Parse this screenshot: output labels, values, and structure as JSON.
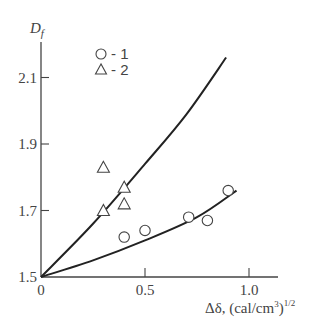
{
  "chart_data": {
    "type": "scatter",
    "title": "",
    "ylabel": "D_f",
    "ylabel_main": "D",
    "ylabel_sub": "f",
    "xlabel": "Δδ, (cal/cm³)^1/2",
    "xlabel_main": "Δδ, (cal/cm",
    "xlabel_sup1": "3",
    "xlabel_close": ")",
    "xlabel_sup2": "1/2",
    "xlim": [
      0,
      1.15
    ],
    "ylim": [
      1.5,
      2.2
    ],
    "x_ticks": [
      {
        "value": 0,
        "label": "0"
      },
      {
        "value": 0.5,
        "label": "0.5"
      },
      {
        "value": 1.0,
        "label": "1.0"
      }
    ],
    "y_ticks": [
      {
        "value": 1.5,
        "label": "1.5"
      },
      {
        "value": 1.7,
        "label": "1.7"
      },
      {
        "value": 1.9,
        "label": "1.9"
      },
      {
        "value": 2.1,
        "label": "2.1"
      }
    ],
    "grid": false,
    "legend_position": "upper-left-inside",
    "series": [
      {
        "name": "1",
        "marker": "circle",
        "legend_label": "- 1",
        "points": [
          {
            "x": 0.4,
            "y": 1.62
          },
          {
            "x": 0.5,
            "y": 1.64
          },
          {
            "x": 0.71,
            "y": 1.68
          },
          {
            "x": 0.8,
            "y": 1.67
          },
          {
            "x": 0.9,
            "y": 1.76
          }
        ]
      },
      {
        "name": "2",
        "marker": "triangle",
        "legend_label": "- 2",
        "points": [
          {
            "x": 0.3,
            "y": 1.83
          },
          {
            "x": 0.4,
            "y": 1.77
          },
          {
            "x": 0.3,
            "y": 1.7
          },
          {
            "x": 0.4,
            "y": 1.72
          }
        ]
      }
    ],
    "curves": [
      {
        "name": "upper-fit-curve",
        "points": [
          {
            "x": 0,
            "y": 1.5
          },
          {
            "x": 0.25,
            "y": 1.66
          },
          {
            "x": 0.5,
            "y": 1.84
          },
          {
            "x": 0.7,
            "y": 1.99
          },
          {
            "x": 0.89,
            "y": 2.16
          }
        ]
      },
      {
        "name": "lower-fit-curve",
        "points": [
          {
            "x": 0,
            "y": 1.5
          },
          {
            "x": 0.25,
            "y": 1.55
          },
          {
            "x": 0.5,
            "y": 1.61
          },
          {
            "x": 0.75,
            "y": 1.68
          },
          {
            "x": 0.94,
            "y": 1.76
          }
        ]
      }
    ]
  }
}
